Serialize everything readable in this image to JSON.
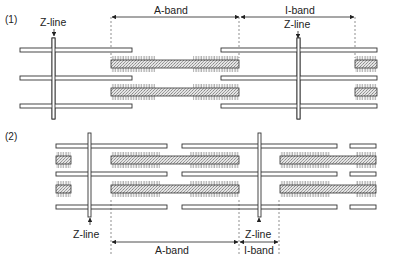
{
  "figure": {
    "panels": [
      {
        "id": "panel-1",
        "label": "(1)",
        "state": "relaxed",
        "labels": {
          "z_line_left": "Z-line",
          "z_line_right": "Z-line",
          "a_band": "A-band",
          "i_band": "I-band"
        }
      },
      {
        "id": "panel-2",
        "label": "(2)",
        "state": "contracted",
        "labels": {
          "z_line_left": "Z-line",
          "z_line_right": "Z-line",
          "a_band": "A-band",
          "i_band": "I-band"
        }
      }
    ]
  },
  "colors": {
    "line": "#333333",
    "stipple": "#c8c8c8",
    "background": "#ffffff"
  }
}
